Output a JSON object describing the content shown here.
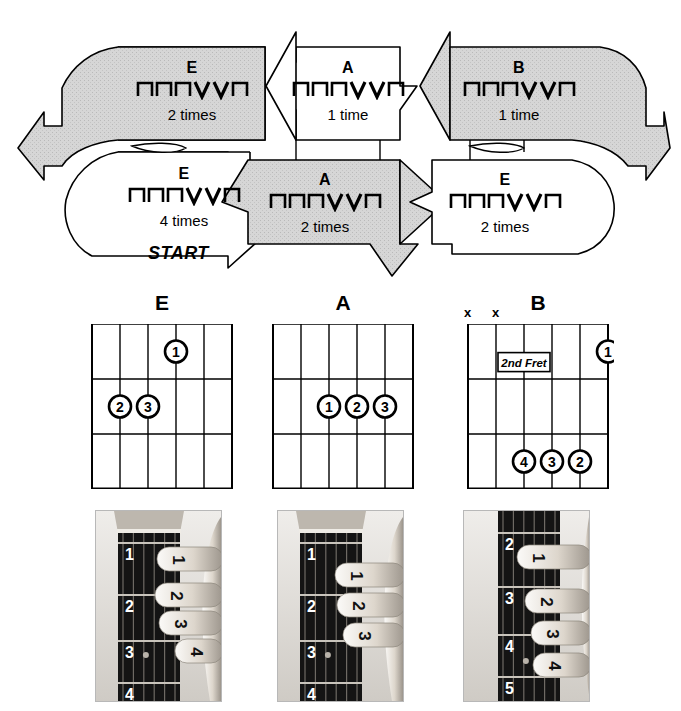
{
  "page": {
    "colors": {
      "shaded_arrow_fill": "#d4d4d4",
      "plain_arrow_fill": "#ffffff",
      "stroke": "#000000",
      "photo_dark": "#1b1b1b",
      "photo_skin": "#d8d0c6"
    }
  },
  "flow": {
    "start_label": "START",
    "strum_pattern_symbols": [
      "down",
      "down",
      "down",
      "up",
      "up",
      "down"
    ],
    "strum_pattern_glyphs": [
      "⊓",
      "⊓",
      "⊓",
      "V",
      "V",
      "⊓"
    ],
    "cells": [
      {
        "id": "cell-1",
        "chord": "E",
        "times": "2 times",
        "shaded": true,
        "pattern": [
          "⊓",
          "⊓",
          "⊓",
          "V",
          "V",
          "⊓"
        ]
      },
      {
        "id": "cell-2",
        "chord": "A",
        "times": "1 time",
        "shaded": false,
        "pattern": [
          "⊓",
          "⊓",
          "⊓",
          "V",
          "V",
          "⊓"
        ]
      },
      {
        "id": "cell-3",
        "chord": "B",
        "times": "1 time",
        "shaded": true,
        "pattern": [
          "⊓",
          "⊓",
          "⊓",
          "V",
          "V",
          "⊓"
        ]
      },
      {
        "id": "cell-4",
        "chord": "E",
        "times": "4 times",
        "shaded": false,
        "pattern": [
          "⊓",
          "⊓",
          "⊓",
          "V",
          "V",
          "⊓"
        ]
      },
      {
        "id": "cell-5",
        "chord": "A",
        "times": "2 times",
        "shaded": true,
        "pattern": [
          "⊓",
          "⊓",
          "⊓",
          "V",
          "V",
          "⊓"
        ]
      },
      {
        "id": "cell-6",
        "chord": "E",
        "times": "2 times",
        "shaded": false,
        "pattern": [
          "⊓",
          "⊓",
          "⊓",
          "V",
          "V",
          "⊓"
        ]
      }
    ]
  },
  "chords": [
    {
      "name": "E",
      "strings": 6,
      "frets": 3,
      "position_label": "",
      "mutes": [],
      "fingers": [
        {
          "label": "1",
          "string": 3,
          "fret": 1
        },
        {
          "label": "2",
          "string": 5,
          "fret": 2
        },
        {
          "label": "3",
          "string": 4,
          "fret": 2
        }
      ]
    },
    {
      "name": "A",
      "strings": 6,
      "frets": 3,
      "position_label": "",
      "mutes": [],
      "fingers": [
        {
          "label": "1",
          "string": 4,
          "fret": 2
        },
        {
          "label": "2",
          "string": 3,
          "fret": 2
        },
        {
          "label": "3",
          "string": 2,
          "fret": 2
        }
      ]
    },
    {
      "name": "B",
      "strings": 6,
      "frets": 3,
      "position_label": "2nd Fret",
      "mutes": [
        "x",
        "x"
      ],
      "fingers": [
        {
          "label": "1",
          "string": 1,
          "fret": 1
        },
        {
          "label": "4",
          "string": 4,
          "fret": 3
        },
        {
          "label": "3",
          "string": 3,
          "fret": 3
        },
        {
          "label": "2",
          "string": 2,
          "fret": 3
        }
      ]
    }
  ],
  "photos": [
    {
      "chord": "E",
      "alt": "Left hand fingering the E chord on a guitar neck",
      "fret_numbers": [
        "1",
        "2",
        "3",
        "4"
      ],
      "finger_numbers": [
        "1",
        "2",
        "3",
        "4"
      ]
    },
    {
      "chord": "A",
      "alt": "Left hand fingering the A chord on a guitar neck",
      "fret_numbers": [
        "1",
        "2",
        "3",
        "4"
      ],
      "finger_numbers": [
        "1",
        "2",
        "3"
      ]
    },
    {
      "chord": "B",
      "alt": "Left hand fingering the B chord on a guitar neck",
      "fret_numbers": [
        "2",
        "3",
        "4",
        "5"
      ],
      "finger_numbers": [
        "1",
        "2",
        "3",
        "4"
      ]
    }
  ]
}
